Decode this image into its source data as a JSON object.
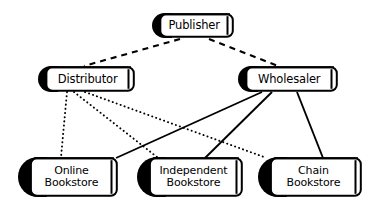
{
  "diagram": {
    "background_color": "#ffffff",
    "ink_color": "#000000",
    "nodes": [
      {
        "id": "publisher",
        "label": "Publisher",
        "icon": "book-icon",
        "x": 152,
        "y": 13,
        "w": 82,
        "h": 25,
        "font_size": 11.5,
        "lines": 1
      },
      {
        "id": "distributor",
        "label": "Distributor",
        "icon": "book-icon",
        "x": 38,
        "y": 66,
        "w": 97,
        "h": 26,
        "font_size": 11.5,
        "lines": 1
      },
      {
        "id": "wholesaler",
        "label": "Wholesaler",
        "icon": "book-icon",
        "x": 238,
        "y": 66,
        "w": 100,
        "h": 26,
        "font_size": 11.5,
        "lines": 1
      },
      {
        "id": "online-bookstore",
        "label": "Online\nBookstore",
        "icon": "book-icon",
        "x": 18,
        "y": 157,
        "w": 100,
        "h": 40,
        "font_size": 11,
        "lines": 2
      },
      {
        "id": "independent-bookstore",
        "label": "Independent\nBookstore",
        "icon": "book-icon",
        "x": 137,
        "y": 157,
        "w": 106,
        "h": 40,
        "font_size": 11,
        "lines": 2
      },
      {
        "id": "chain-bookstore",
        "label": "Chain\nBookstore",
        "icon": "book-icon",
        "x": 258,
        "y": 157,
        "w": 104,
        "h": 40,
        "font_size": 11,
        "lines": 2
      }
    ],
    "edges": [
      {
        "id": "publisher-distributor",
        "from": "publisher",
        "to": "distributor",
        "style": "dashed",
        "x1": 180,
        "y1": 39,
        "x2": 84,
        "y2": 66,
        "width": 2.1,
        "dash": "6,5"
      },
      {
        "id": "publisher-wholesaler",
        "from": "publisher",
        "to": "wholesaler",
        "style": "dashed",
        "x1": 209,
        "y1": 39,
        "x2": 278,
        "y2": 66,
        "width": 2.1,
        "dash": "6,5"
      },
      {
        "id": "distributor-online",
        "from": "distributor",
        "to": "online-bookstore",
        "style": "dotted",
        "x1": 67,
        "y1": 92,
        "x2": 61,
        "y2": 157,
        "width": 1.9,
        "dash": "0.2,4"
      },
      {
        "id": "distributor-independent",
        "from": "distributor",
        "to": "independent-bookstore",
        "style": "dotted",
        "x1": 74,
        "y1": 92,
        "x2": 157,
        "y2": 157,
        "width": 1.9,
        "dash": "0.2,4"
      },
      {
        "id": "distributor-chain",
        "from": "distributor",
        "to": "chain-bookstore",
        "style": "dotted",
        "x1": 85,
        "y1": 92,
        "x2": 264,
        "y2": 157,
        "width": 1.9,
        "dash": "0.2,4"
      },
      {
        "id": "wholesaler-online",
        "from": "wholesaler",
        "to": "online-bookstore",
        "style": "solid",
        "x1": 262,
        "y1": 92,
        "x2": 116,
        "y2": 158,
        "width": 1.9,
        "dash": ""
      },
      {
        "id": "wholesaler-independent",
        "from": "wholesaler",
        "to": "independent-bookstore",
        "style": "solid",
        "x1": 272,
        "y1": 92,
        "x2": 205,
        "y2": 158,
        "width": 1.9,
        "dash": ""
      },
      {
        "id": "wholesaler-chain",
        "from": "wholesaler",
        "to": "chain-bookstore",
        "style": "solid",
        "x1": 297,
        "y1": 92,
        "x2": 323,
        "y2": 158,
        "width": 1.9,
        "dash": ""
      }
    ]
  }
}
